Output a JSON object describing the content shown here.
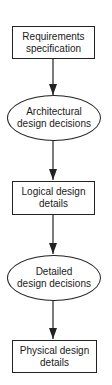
{
  "diagram": {
    "type": "flowchart",
    "direction": "top-to-bottom",
    "nodes": [
      {
        "id": "n1",
        "shape": "rectangle",
        "label": "Requirements specification",
        "lines": [
          "Requirements",
          "specification"
        ]
      },
      {
        "id": "n2",
        "shape": "ellipse",
        "label": "Architectural design decisions",
        "lines": [
          "Architectural",
          "design decisions"
        ]
      },
      {
        "id": "n3",
        "shape": "rectangle",
        "label": "Logical design details",
        "lines": [
          "Logical design",
          "details"
        ]
      },
      {
        "id": "n4",
        "shape": "ellipse",
        "label": "Detailed design decisions",
        "lines": [
          "Detailed",
          "design decisions"
        ]
      },
      {
        "id": "n5",
        "shape": "rectangle",
        "label": "Physical design details",
        "lines": [
          "Physical design",
          "details"
        ]
      }
    ],
    "edges": [
      {
        "from": "n1",
        "to": "n2"
      },
      {
        "from": "n2",
        "to": "n3"
      },
      {
        "from": "n3",
        "to": "n4"
      },
      {
        "from": "n4",
        "to": "n5"
      }
    ],
    "colors": {
      "stroke": "#222222",
      "background": "#ffffff",
      "text": "#1a1a1a"
    }
  }
}
